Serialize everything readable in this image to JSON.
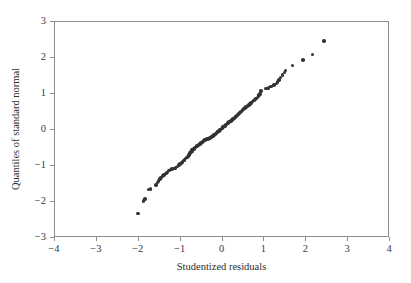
{
  "chart_data": {
    "type": "scatter",
    "title": "",
    "subtitle": "",
    "xlabel": "Studentized residuals",
    "ylabel": "Quantiles of standard normal",
    "xlim": [
      -4,
      4
    ],
    "ylim": [
      -3,
      3
    ],
    "xticks": [
      -4,
      -3,
      -2,
      -1,
      0,
      1,
      2,
      3,
      4
    ],
    "yticks": [
      -3,
      -2,
      -1,
      0,
      1,
      2,
      3
    ],
    "xticklabels": [
      "−4",
      "−3",
      "−2",
      "−1",
      "0",
      "1",
      "2",
      "3",
      "4"
    ],
    "yticklabels": [
      "−3",
      "−2",
      "−1",
      "0",
      "1",
      "2",
      "3"
    ],
    "grid": false,
    "legend": null,
    "annotations": [],
    "marker": {
      "shape": "circle",
      "color": "#333333",
      "size_px": 3.6
    },
    "frame_color": "#8d8d8d",
    "background": "#ffffff",
    "series": [
      {
        "name": "qq-points",
        "points": [
          [
            -2.0,
            -2.35
          ],
          [
            -1.86,
            -2.0
          ],
          [
            -1.82,
            -1.95
          ],
          [
            -1.74,
            -1.68
          ],
          [
            -1.7,
            -1.66
          ],
          [
            -1.56,
            -1.56
          ],
          [
            -1.53,
            -1.49
          ],
          [
            -1.5,
            -1.44
          ],
          [
            -1.47,
            -1.39
          ],
          [
            -1.44,
            -1.35
          ],
          [
            -1.41,
            -1.31
          ],
          [
            -1.38,
            -1.27
          ],
          [
            -1.33,
            -1.24
          ],
          [
            -1.3,
            -1.21
          ],
          [
            -1.25,
            -1.15
          ],
          [
            -1.21,
            -1.13
          ],
          [
            -1.18,
            -1.11
          ],
          [
            -1.14,
            -1.1
          ],
          [
            -1.1,
            -1.08
          ],
          [
            -1.05,
            -1.04
          ],
          [
            -1.02,
            -1.0
          ],
          [
            -0.99,
            -0.97
          ],
          [
            -0.96,
            -0.94
          ],
          [
            -0.93,
            -0.91
          ],
          [
            -0.9,
            -0.88
          ],
          [
            -0.88,
            -0.85
          ],
          [
            -0.86,
            -0.82
          ],
          [
            -0.83,
            -0.79
          ],
          [
            -0.8,
            -0.76
          ],
          [
            -0.78,
            -0.73
          ],
          [
            -0.76,
            -0.7
          ],
          [
            -0.75,
            -0.67
          ],
          [
            -0.73,
            -0.64
          ],
          [
            -0.71,
            -0.62
          ],
          [
            -0.7,
            -0.59
          ],
          [
            -0.68,
            -0.57
          ],
          [
            -0.66,
            -0.55
          ],
          [
            -0.64,
            -0.53
          ],
          [
            -0.62,
            -0.51
          ],
          [
            -0.6,
            -0.49
          ],
          [
            -0.58,
            -0.47
          ],
          [
            -0.55,
            -0.45
          ],
          [
            -0.53,
            -0.43
          ],
          [
            -0.51,
            -0.41
          ],
          [
            -0.49,
            -0.39
          ],
          [
            -0.47,
            -0.37
          ],
          [
            -0.45,
            -0.35
          ],
          [
            -0.43,
            -0.33
          ],
          [
            -0.41,
            -0.31
          ],
          [
            -0.39,
            -0.3
          ],
          [
            -0.36,
            -0.29
          ],
          [
            -0.34,
            -0.28
          ],
          [
            -0.32,
            -0.27
          ],
          [
            -0.3,
            -0.26
          ],
          [
            -0.28,
            -0.25
          ],
          [
            -0.26,
            -0.24
          ],
          [
            -0.24,
            -0.22
          ],
          [
            -0.22,
            -0.21
          ],
          [
            -0.2,
            -0.19
          ],
          [
            -0.18,
            -0.17
          ],
          [
            -0.16,
            -0.15
          ],
          [
            -0.14,
            -0.13
          ],
          [
            -0.12,
            -0.11
          ],
          [
            -0.1,
            -0.09
          ],
          [
            -0.08,
            -0.07
          ],
          [
            -0.06,
            -0.05
          ],
          [
            -0.04,
            -0.03
          ],
          [
            -0.02,
            -0.01
          ],
          [
            0.0,
            0.01
          ],
          [
            0.02,
            0.03
          ],
          [
            0.04,
            0.05
          ],
          [
            0.06,
            0.07
          ],
          [
            0.08,
            0.09
          ],
          [
            0.1,
            0.11
          ],
          [
            0.12,
            0.13
          ],
          [
            0.14,
            0.15
          ],
          [
            0.16,
            0.17
          ],
          [
            0.18,
            0.19
          ],
          [
            0.2,
            0.21
          ],
          [
            0.23,
            0.23
          ],
          [
            0.25,
            0.25
          ],
          [
            0.27,
            0.27
          ],
          [
            0.29,
            0.29
          ],
          [
            0.31,
            0.31
          ],
          [
            0.33,
            0.33
          ],
          [
            0.35,
            0.35
          ],
          [
            0.37,
            0.38
          ],
          [
            0.39,
            0.4
          ],
          [
            0.42,
            0.43
          ],
          [
            0.44,
            0.46
          ],
          [
            0.47,
            0.49
          ],
          [
            0.5,
            0.52
          ],
          [
            0.53,
            0.55
          ],
          [
            0.56,
            0.58
          ],
          [
            0.59,
            0.61
          ],
          [
            0.62,
            0.64
          ],
          [
            0.65,
            0.67
          ],
          [
            0.68,
            0.7
          ],
          [
            0.71,
            0.73
          ],
          [
            0.74,
            0.76
          ],
          [
            0.77,
            0.79
          ],
          [
            0.8,
            0.82
          ],
          [
            0.83,
            0.85
          ],
          [
            0.86,
            0.88
          ],
          [
            0.88,
            0.91
          ],
          [
            0.9,
            0.94
          ],
          [
            0.92,
            0.97
          ],
          [
            0.94,
            1.06
          ],
          [
            1.06,
            1.12
          ],
          [
            1.12,
            1.14
          ],
          [
            1.18,
            1.18
          ],
          [
            1.25,
            1.22
          ],
          [
            1.31,
            1.26
          ],
          [
            1.34,
            1.31
          ],
          [
            1.38,
            1.36
          ],
          [
            1.41,
            1.43
          ],
          [
            1.46,
            1.5
          ],
          [
            1.5,
            1.57
          ],
          [
            1.53,
            1.62
          ],
          [
            1.7,
            1.76
          ],
          [
            1.95,
            1.92
          ],
          [
            2.17,
            2.07
          ],
          [
            2.45,
            2.44
          ]
        ]
      }
    ]
  }
}
